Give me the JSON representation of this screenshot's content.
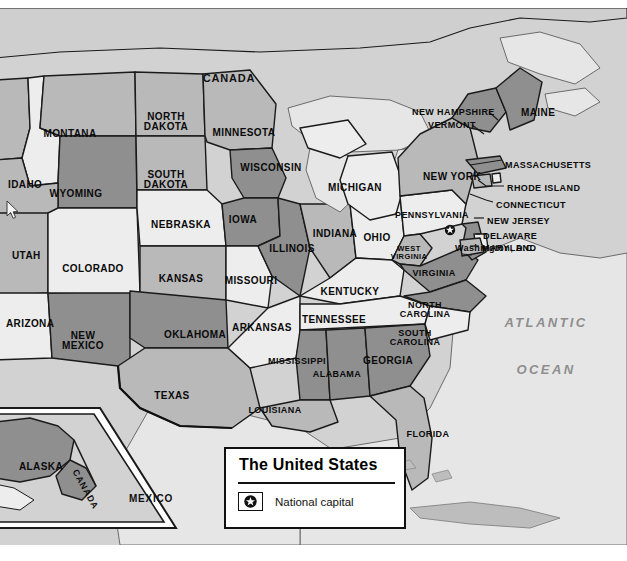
{
  "legend": {
    "title": "The United States",
    "capital_label": "National capital",
    "capital_icon": "star-in-circle-icon"
  },
  "oceans": [
    {
      "name": "ATLANTIC",
      "x": 546,
      "y": 308
    },
    {
      "name": "OCEAN",
      "x": 546,
      "y": 355
    }
  ],
  "countries": [
    {
      "name": "CANADA",
      "x": 229,
      "y": 65,
      "size": "l11"
    },
    {
      "name": "MEXICO",
      "x": 151,
      "y": 486,
      "size": "l10"
    },
    {
      "name": "CANADA",
      "x": 85,
      "y": 477,
      "size": "l9",
      "rotated": true
    }
  ],
  "capital_marker": {
    "name": "Washington, D.C.",
    "x": 455,
    "y": 236
  },
  "states": [
    {
      "name": "MONTANA",
      "x": 70,
      "y": 121,
      "size": "l10"
    },
    {
      "name": "NORTH\nDAKOTA",
      "x": 166,
      "y": 104,
      "size": "l10"
    },
    {
      "name": "MINNESOTA",
      "x": 244,
      "y": 120,
      "size": "l10"
    },
    {
      "name": "IDAHO",
      "x": 8,
      "y": 172,
      "size": "l10",
      "align": "left"
    },
    {
      "name": "WYOMING",
      "x": 76,
      "y": 181,
      "size": "l10"
    },
    {
      "name": "SOUTH\nDAKOTA",
      "x": 166,
      "y": 162,
      "size": "l10"
    },
    {
      "name": "WISCONSIN",
      "x": 271,
      "y": 155,
      "size": "l10"
    },
    {
      "name": "MICHIGAN",
      "x": 355,
      "y": 175,
      "size": "l10"
    },
    {
      "name": "UTAH",
      "x": 12,
      "y": 243,
      "size": "l10",
      "align": "left"
    },
    {
      "name": "COLORADO",
      "x": 93,
      "y": 256,
      "size": "l10"
    },
    {
      "name": "NEBRASKA",
      "x": 181,
      "y": 212,
      "size": "l10"
    },
    {
      "name": "IOWA",
      "x": 243,
      "y": 207,
      "size": "l10"
    },
    {
      "name": "ILLINOIS",
      "x": 292,
      "y": 236,
      "size": "l10"
    },
    {
      "name": "INDIANA",
      "x": 335,
      "y": 221,
      "size": "l10"
    },
    {
      "name": "OHIO",
      "x": 377,
      "y": 225,
      "size": "l10"
    },
    {
      "name": "KANSAS",
      "x": 181,
      "y": 266,
      "size": "l10"
    },
    {
      "name": "MISSOURI",
      "x": 251,
      "y": 268,
      "size": "l10"
    },
    {
      "name": "KENTUCKY",
      "x": 350,
      "y": 279,
      "size": "l10"
    },
    {
      "name": "ARIZONA",
      "x": 6,
      "y": 311,
      "size": "l10",
      "align": "left"
    },
    {
      "name": "NEW\nMEXICO",
      "x": 83,
      "y": 323,
      "size": "l10"
    },
    {
      "name": "OKLAHOMA",
      "x": 195,
      "y": 322,
      "size": "l10"
    },
    {
      "name": "ARKANSAS",
      "x": 262,
      "y": 315,
      "size": "l10"
    },
    {
      "name": "TENNESSEE",
      "x": 334,
      "y": 307,
      "size": "l10"
    },
    {
      "name": "NORTH\nCAROLINA",
      "x": 425,
      "y": 293,
      "size": "l9"
    },
    {
      "name": "SOUTH\nCAROLINA",
      "x": 415,
      "y": 321,
      "size": "l9"
    },
    {
      "name": "MISSISSIPPI",
      "x": 297,
      "y": 349,
      "size": "l9"
    },
    {
      "name": "ALABAMA",
      "x": 337,
      "y": 362,
      "size": "l9"
    },
    {
      "name": "GEORGIA",
      "x": 388,
      "y": 348,
      "size": "l10"
    },
    {
      "name": "TEXAS",
      "x": 172,
      "y": 383,
      "size": "l10"
    },
    {
      "name": "LOUISIANA",
      "x": 275,
      "y": 398,
      "size": "l9"
    },
    {
      "name": "FLORIDA",
      "x": 428,
      "y": 422,
      "size": "l9"
    },
    {
      "name": "WEST\nVIRGINIA",
      "x": 409,
      "y": 237,
      "size": "l75"
    },
    {
      "name": "VIRGINIA",
      "x": 434,
      "y": 261,
      "size": "l9"
    },
    {
      "name": "PENNSYLVANIA",
      "x": 432,
      "y": 203,
      "size": "l9"
    },
    {
      "name": "NEW YORK",
      "x": 452,
      "y": 164,
      "size": "l10"
    },
    {
      "name": "ALASKA",
      "x": 41,
      "y": 454,
      "size": "l10"
    }
  ],
  "callout_states": [
    {
      "name": "NEW HAMPSHIRE",
      "x": 412,
      "y": 100,
      "size": "l9",
      "align": "left"
    },
    {
      "name": "VERMONT",
      "x": 428,
      "y": 113,
      "size": "l9",
      "align": "left"
    },
    {
      "name": "MAINE",
      "x": 521,
      "y": 100,
      "size": "l10",
      "align": "left"
    },
    {
      "name": "MASSACHUSETTS",
      "x": 505,
      "y": 153,
      "size": "l9",
      "align": "left"
    },
    {
      "name": "RHODE ISLAND",
      "x": 507,
      "y": 176,
      "size": "l9",
      "align": "left"
    },
    {
      "name": "CONNECTICUT",
      "x": 496,
      "y": 193,
      "size": "l9",
      "align": "left"
    },
    {
      "name": "NEW JERSEY",
      "x": 487,
      "y": 209,
      "size": "l9",
      "align": "left"
    },
    {
      "name": "DELAWARE",
      "x": 483,
      "y": 224,
      "size": "l9",
      "align": "left"
    },
    {
      "name": "MARYLAND",
      "x": 482,
      "y": 236,
      "size": "l9",
      "align": "left"
    }
  ],
  "colors": {
    "land_light": "#ededed",
    "land_mid": "#b9b9b9",
    "land_dark": "#8f8f8f",
    "water": "#e6e6e6",
    "backdrop": "#d2d2d2",
    "outline": "#1a1a1a",
    "ocean_text": "#8e8e8e"
  }
}
